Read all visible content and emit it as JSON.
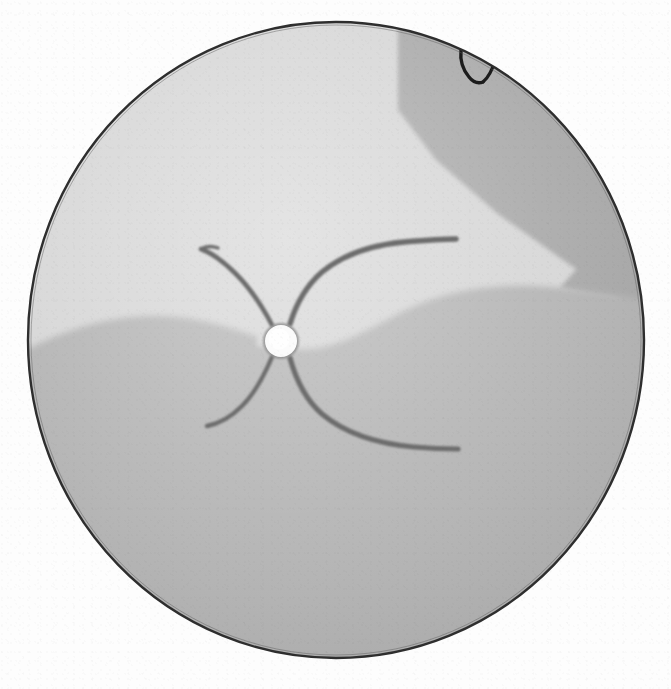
{
  "figure": {
    "kind": "retinal-fundus-drawing",
    "description": "Hand-drawn grayscale fundus chart of the right eye showing an inferior retinal detachment with a horseshoe tear in the superior temporal periphery.",
    "background_color": "#fdfdfd"
  },
  "globe": {
    "name": "fundus-outline",
    "center_x": 336,
    "center_y": 340,
    "radius_x": 308,
    "radius_y": 318,
    "outline_color": "#2e2e2e",
    "outline_width": 2.4
  },
  "regions": [
    {
      "id": "attached-retina",
      "label": "Attached retina",
      "color": "#d6d6d6",
      "zone": "superior",
      "notes": "Pale upper two-fifths of the globe."
    },
    {
      "id": "detached-retina",
      "label": "Detached retina",
      "color": "#b4b4b4",
      "zone": "inferior",
      "notes": "Mid-gray lower region bounded by a wavy demarcation line that rises toward the optic disc."
    },
    {
      "id": "peripheral-band",
      "label": "Peripheral crescent",
      "color": "#a9a9a9",
      "zone": "superior-temporal-periphery",
      "notes": "Darker crescent along the upper-right rim with a straight diagonal inner border."
    }
  ],
  "optic_disc": {
    "name": "optic-disc",
    "label": "Optic disc",
    "center_x": 281,
    "center_y": 341,
    "radius": 16,
    "fill_color": "#fbfbfb",
    "rim_color": "#8f8f8f"
  },
  "vessels": {
    "label": "Retinal vascular arcades",
    "stroke_color": "#6d6d6d",
    "branches": [
      {
        "id": "superior-nasal",
        "label": "Superior nasal arcade",
        "tip_x": 200,
        "tip_y": 248,
        "width": 4.6
      },
      {
        "id": "superior-temporal",
        "label": "Superior temporal arcade",
        "tip_x": 456,
        "tip_y": 239,
        "width": 5.4
      },
      {
        "id": "inferior-nasal",
        "label": "Inferior nasal arcade",
        "tip_x": 206,
        "tip_y": 426,
        "width": 4.4
      },
      {
        "id": "inferior-temporal",
        "label": "Inferior temporal arcade",
        "tip_x": 458,
        "tip_y": 449,
        "width": 5.2
      }
    ]
  },
  "annotations": [
    {
      "id": "horseshoe-tear-mark",
      "glyph": "V",
      "label": "Horseshoe retinal tear",
      "x": 474,
      "y": 67,
      "color": "#1d1d1d",
      "notes": "Hand-inked V-shaped flap tear drawn inside the superior temporal peripheral band."
    }
  ],
  "legend": {
    "visible": false,
    "entries": []
  }
}
